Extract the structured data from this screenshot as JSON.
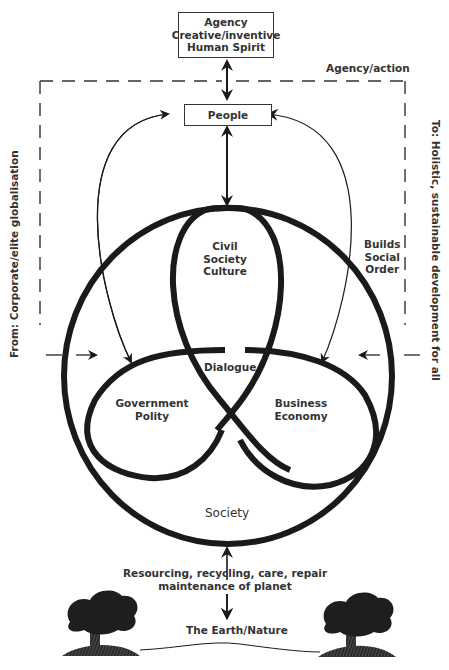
{
  "diagram": {
    "top_box": {
      "line1": "Agency",
      "line2": "Creative/inventive",
      "line3": "Human Spirit"
    },
    "agency_action_label": "Agency/action",
    "people_box": "People",
    "left_side_label": "From: Corporate/elite globalisation",
    "right_side_label": "To: Holistic, sustainable development for all",
    "builds_social_order": {
      "line1": "Builds",
      "line2": "Social",
      "line3": "Order"
    },
    "lobes": {
      "top": {
        "line1": "Civil",
        "line2": "Society",
        "line3": "Culture"
      },
      "left": {
        "line1": "Government",
        "line2": "Polity"
      },
      "right": {
        "line1": "Business",
        "line2": "Economy"
      }
    },
    "center_label": "Dialogue",
    "circle_label": "Society",
    "bottom_text": {
      "line1": "Resourcing, recycling, care, repair",
      "line2": "maintenance of planet"
    },
    "earth_label": "The Earth/Nature",
    "icons": [
      "tree-icon-left",
      "tree-icon-right"
    ],
    "colors": {
      "stroke": "#1a1a1a",
      "text": "#333333",
      "background": "#ffffff"
    }
  }
}
